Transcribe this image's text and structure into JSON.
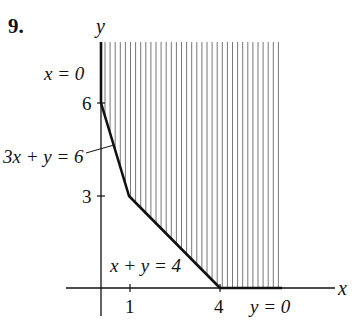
{
  "problem_number": "9.",
  "axes": {
    "x_label": "x",
    "y_label": "y",
    "x_ticks": [
      {
        "value": 1,
        "label": "1"
      },
      {
        "value": 4,
        "label": "4"
      }
    ],
    "y_ticks": [
      {
        "value": 3,
        "label": "3"
      },
      {
        "value": 6,
        "label": "6"
      }
    ]
  },
  "boundaries": {
    "x_eq_0": "x = 0",
    "three_x_plus_y_eq_6": "3x + y = 6",
    "x_plus_y_eq_4": "x + y = 4",
    "y_eq_0": "y = 0"
  },
  "region": {
    "description": "feasible region (shaded, unbounded)",
    "vertices": [
      [
        0,
        6
      ],
      [
        1,
        3
      ],
      [
        4,
        0
      ]
    ],
    "shading": "vertical-hatch"
  },
  "colors": {
    "ink": "#111111",
    "hatch": "#777777",
    "background": "#ffffff"
  }
}
